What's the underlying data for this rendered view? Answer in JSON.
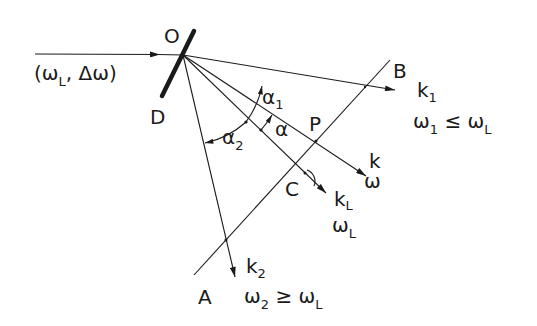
{
  "diagram": {
    "type": "optical-geometry",
    "labels": {
      "origin": "O",
      "mirror": "D",
      "point_a": "A",
      "point_b": "B",
      "point_c": "C",
      "point_p": "P",
      "incident": "(ω",
      "incident_sub": "L",
      "incident_rest": ", Δω)",
      "k1": "k",
      "k1_sub": "1",
      "omega1": "ω",
      "omega1_sub": "1",
      "omega1_rel": " ≤ ω",
      "omega1_rel_sub": "L",
      "k": "k",
      "omega": "ω",
      "kL": "k",
      "kL_sub": "L",
      "omegaL": "ω",
      "omegaL_sub": "L",
      "k2": "k",
      "k2_sub": "2",
      "omega2": "ω",
      "omega2_sub": "2",
      "omega2_rel": " ≥ ω",
      "omega2_rel_sub": "L",
      "alpha1": "α",
      "alpha1_sub": "1",
      "alpha2": "α",
      "alpha2_sub": "2",
      "alpha": "α"
    },
    "colors": {
      "ink": "#1a1a1a",
      "background": "#ffffff"
    }
  }
}
